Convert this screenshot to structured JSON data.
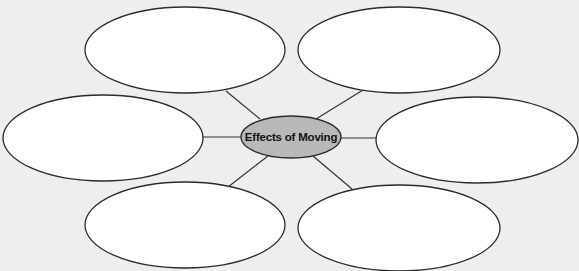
{
  "diagram": {
    "type": "web-organizer",
    "center": {
      "label": "Effects of Moving",
      "fill": "#b9b9b9",
      "cx": 291,
      "cy": 137,
      "rx": 50,
      "ry": 21
    },
    "branches": [
      {
        "id": "top-left",
        "text": "",
        "cx": 185,
        "cy": 50,
        "rx": 100,
        "ry": 43,
        "line": [
          260,
          119,
          226,
          91
        ]
      },
      {
        "id": "top-right",
        "text": "",
        "cx": 399,
        "cy": 50,
        "rx": 101,
        "ry": 43,
        "line": [
          316,
          119,
          363,
          90
        ]
      },
      {
        "id": "middle-left",
        "text": "",
        "cx": 103,
        "cy": 138,
        "rx": 100,
        "ry": 43,
        "line": [
          242,
          137,
          203,
          137
        ]
      },
      {
        "id": "middle-right",
        "text": "",
        "cx": 477,
        "cy": 140,
        "rx": 101,
        "ry": 43,
        "line": [
          341,
          138,
          377,
          138
        ]
      },
      {
        "id": "bottom-left",
        "text": "",
        "cx": 185,
        "cy": 225,
        "rx": 100,
        "ry": 43,
        "line": [
          268,
          156,
          228,
          187
        ]
      },
      {
        "id": "bottom-right",
        "text": "",
        "cx": 399,
        "cy": 228,
        "rx": 101,
        "ry": 43,
        "line": [
          313,
          156,
          352,
          189
        ]
      }
    ],
    "colors": {
      "background": "#eeeeec",
      "ellipse_fill": "#ffffff",
      "stroke": "#2b2b2b"
    }
  }
}
